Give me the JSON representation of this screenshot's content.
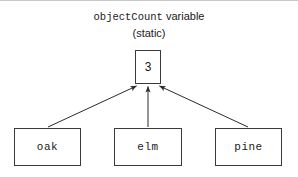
{
  "diagram": {
    "title": {
      "line1_mono": "objectCount",
      "line1_sans": " variable",
      "line2": "(static)"
    },
    "counter_node": {
      "label": "3",
      "name": "object-count-value"
    },
    "instance_nodes": [
      {
        "label": "oak"
      },
      {
        "label": "elm"
      },
      {
        "label": "pine"
      }
    ],
    "edges": [
      {
        "from": "oak",
        "to": "objectCount",
        "style": "arrow"
      },
      {
        "from": "elm",
        "to": "objectCount",
        "style": "arrow"
      },
      {
        "from": "pine",
        "to": "objectCount",
        "style": "arrow"
      }
    ],
    "colors": {
      "background": "#ffffff",
      "stroke": "#3a3a3a",
      "text": "#1a1a1a",
      "rule": "#c9c9c9"
    }
  }
}
